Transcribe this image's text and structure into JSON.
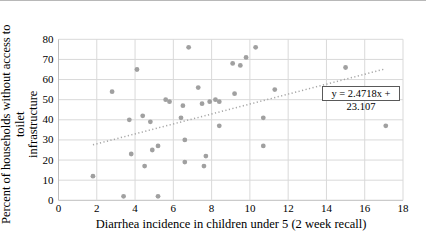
{
  "chart_data": {
    "type": "scatter",
    "title": "",
    "xlabel": "Diarrhea incidence in children under 5 (2 week recall)",
    "ylabel": "Percent of households without access to toilet infrastructure",
    "ylabel_line1": "Percent of households without access to toilet",
    "ylabel_line2": "infrastructure",
    "xlim": [
      0,
      18
    ],
    "ylim": [
      0,
      80
    ],
    "xticks": [
      0,
      2,
      4,
      6,
      8,
      10,
      12,
      14,
      16,
      18
    ],
    "yticks": [
      0,
      10,
      20,
      30,
      40,
      50,
      60,
      70,
      80
    ],
    "grid": true,
    "legend_position": "none",
    "points": [
      [
        1.8,
        12
      ],
      [
        2.8,
        54
      ],
      [
        3.4,
        2
      ],
      [
        3.7,
        40
      ],
      [
        3.8,
        23
      ],
      [
        4.1,
        65
      ],
      [
        4.4,
        42
      ],
      [
        4.5,
        17
      ],
      [
        4.8,
        39
      ],
      [
        4.9,
        25
      ],
      [
        5.2,
        27
      ],
      [
        5.2,
        2
      ],
      [
        5.6,
        50
      ],
      [
        5.8,
        49
      ],
      [
        6.4,
        41
      ],
      [
        6.5,
        47
      ],
      [
        6.6,
        30
      ],
      [
        6.6,
        19
      ],
      [
        6.8,
        76
      ],
      [
        7.3,
        56
      ],
      [
        7.5,
        48
      ],
      [
        7.6,
        17
      ],
      [
        7.7,
        22
      ],
      [
        7.9,
        49
      ],
      [
        8.2,
        50
      ],
      [
        8.4,
        49
      ],
      [
        8.4,
        37
      ],
      [
        9.1,
        68
      ],
      [
        9.2,
        53
      ],
      [
        9.5,
        67
      ],
      [
        9.8,
        71
      ],
      [
        10.3,
        76
      ],
      [
        10.7,
        41
      ],
      [
        10.7,
        27
      ],
      [
        11.3,
        55
      ],
      [
        15.0,
        66
      ],
      [
        17.1,
        37
      ]
    ],
    "trendline": {
      "equation_label": "y = 2.4718x + 23.107",
      "slope": 2.4718,
      "intercept": 23.107,
      "x_start": 1.8,
      "x_end": 17.0,
      "style": "dotted"
    },
    "colors": {
      "point": "#a0a0a0",
      "trend": "#a6a6a6",
      "grid": "#d9d9d9",
      "axis": "#bfbfbf",
      "text": "#000000"
    }
  }
}
